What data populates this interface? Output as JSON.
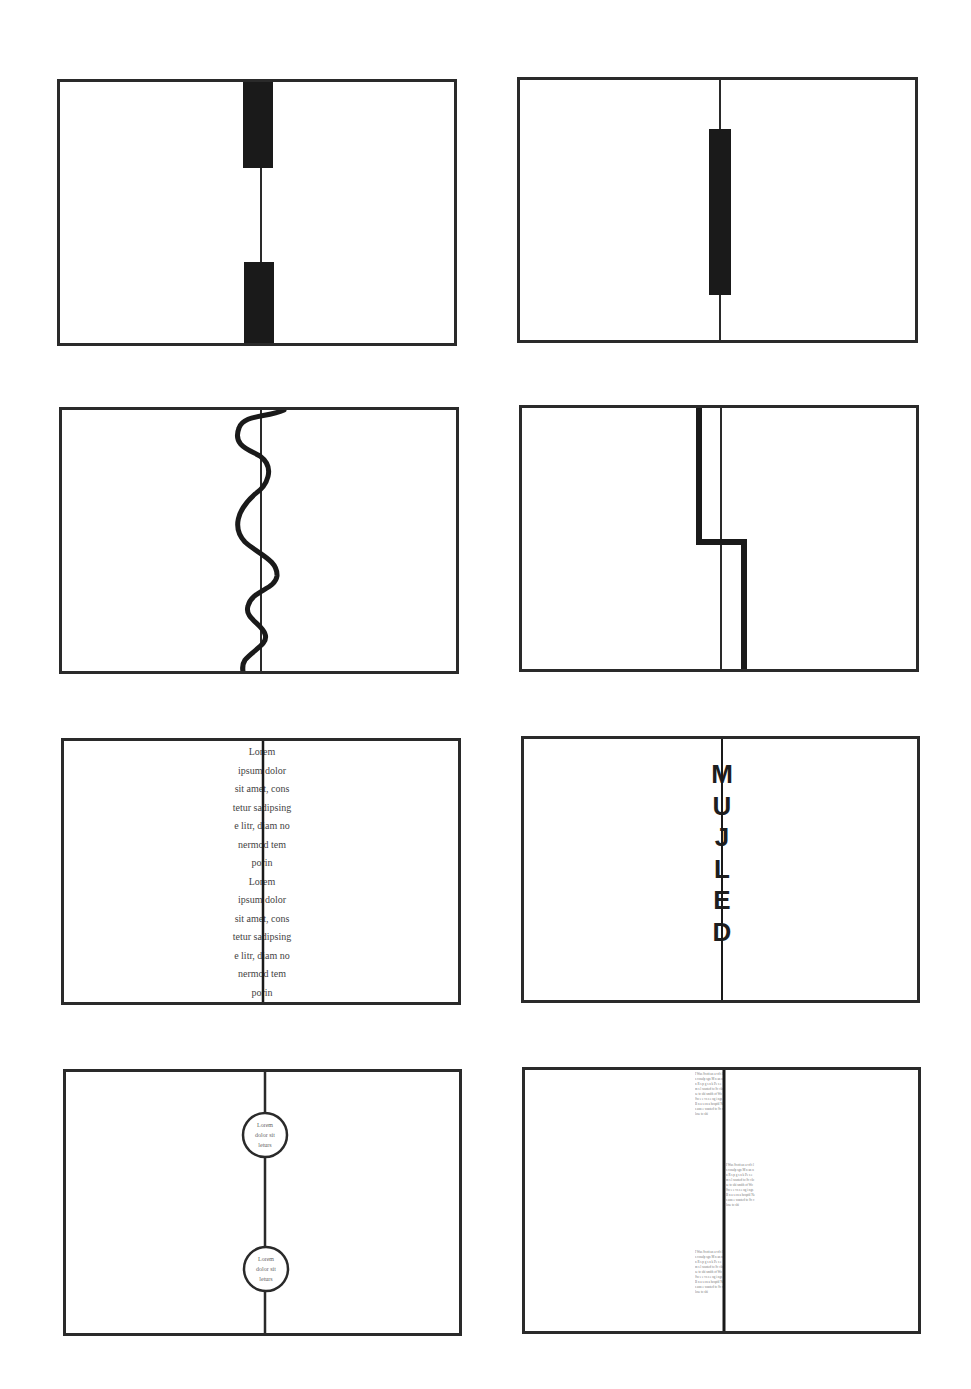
{
  "figure": {
    "panels": [
      {
        "id": 1,
        "type": "two-black-blocks-on-line"
      },
      {
        "id": 2,
        "type": "single-black-bar-on-line"
      },
      {
        "id": 3,
        "type": "wavy-line-over-center"
      },
      {
        "id": 4,
        "type": "stepped-thick-line"
      },
      {
        "id": 5,
        "type": "centered-text-over-line"
      },
      {
        "id": 6,
        "type": "vertical-letters-over-line"
      },
      {
        "id": 7,
        "type": "circles-with-text-on-line"
      },
      {
        "id": 8,
        "type": "text-columns-along-line"
      }
    ]
  },
  "panel5": {
    "lines": [
      "Lorem",
      "ipsum dolor",
      "sit amet, cons",
      "tetur sadipsing",
      "e litr, diam no",
      "nermod tem",
      "porin",
      "Lorem",
      "ipsum dolor",
      "sit amet, cons",
      "tetur sadipsing",
      "e litr, diam no",
      "nermod tem",
      "porin"
    ]
  },
  "panel6": {
    "letters": [
      "M",
      "U",
      "J",
      "L",
      "E",
      "D"
    ]
  },
  "panel7": {
    "circle1": [
      "Lorem",
      "dolor sit",
      "leturs"
    ],
    "circle2": [
      "Lorem",
      "dolor sit",
      "leturs"
    ]
  },
  "panel8": {
    "block_text": "I Was Scott an a vd t ls cosulp sgn M n an nn R s p g s n k Pe s e m s l wanted to Sc close to shi smith of Wo Sw e e  vs s e ng i ngs B n a s on a hospitl Ne s ann e wanted to Sc close to shi"
  },
  "colors": {
    "line": "#2a2a2a",
    "fill": "#1a1a1a",
    "background": "#ffffff",
    "text": "#444444"
  }
}
